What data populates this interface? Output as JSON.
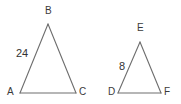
{
  "figure": {
    "background_color": "#ffffff",
    "stroke_color": "#6e6e6e",
    "label_color": "#3a3a3a",
    "width": 181,
    "height": 104,
    "triangles": [
      {
        "name": "triangle-abc",
        "vertices": [
          {
            "label": "A",
            "x": 20,
            "y": 93
          },
          {
            "label": "B",
            "x": 48,
            "y": 24
          },
          {
            "label": "C",
            "x": 76,
            "y": 93
          }
        ],
        "side_labels": [
          {
            "label": "24",
            "side": "AB"
          }
        ]
      },
      {
        "name": "triangle-def",
        "vertices": [
          {
            "label": "D",
            "x": 118,
            "y": 93
          },
          {
            "label": "E",
            "x": 140,
            "y": 42
          },
          {
            "label": "F",
            "x": 161,
            "y": 93
          }
        ],
        "side_labels": [
          {
            "label": "8",
            "side": "DE"
          }
        ]
      }
    ]
  }
}
